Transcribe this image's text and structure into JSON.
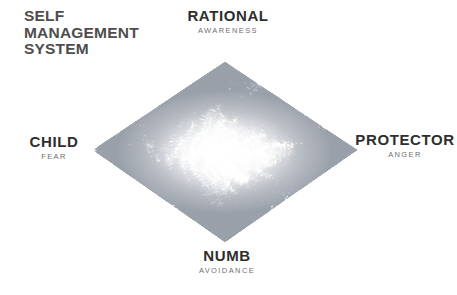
{
  "title": {
    "lines": [
      "SELF",
      "MANAGEMENT",
      "SYSTEM"
    ]
  },
  "poles": {
    "rational": {
      "name": "RATIONAL",
      "trait": "AWARENESS"
    },
    "child": {
      "name": "CHILD",
      "trait": "FEAR"
    },
    "protector": {
      "name": "PROTECTOR",
      "trait": "ANGER"
    },
    "numb": {
      "name": "NUMB",
      "trait": "AVOIDANCE"
    }
  },
  "colors": {
    "title": "#4d4d4d",
    "pole_name": "#2e2e2e",
    "pole_trait": "#6f6f6f",
    "cloud_word": "#9aa0aa",
    "background": "#ffffff"
  },
  "cloud": {
    "shape": "diamond",
    "vertices": {
      "left": [
        93,
        150
      ],
      "top": [
        225,
        62
      ],
      "right": [
        357,
        150
      ],
      "bottom": [
        225,
        242
      ]
    },
    "words": {
      "top_quadrant": "RATIONAL",
      "bottom_quadrant": "NUMB",
      "left_quadrant": "FEAR",
      "right_quadrant": "ANGER"
    },
    "density_note": "densest and darkest along the four edges, fading to near-white at the center"
  }
}
